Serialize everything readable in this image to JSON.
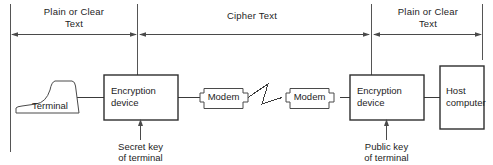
{
  "diagram": {
    "stroke_color": "#3a3a3a",
    "text_color": "#1d1d1d",
    "background": "#ffffff",
    "zones": [
      {
        "id": "zone-left",
        "label_line1": "Plain or Clear",
        "label_line2": "Text"
      },
      {
        "id": "zone-middle",
        "label_line1": "Cipher Text",
        "label_line2": ""
      },
      {
        "id": "zone-right",
        "label_line1": "Plain or Clear",
        "label_line2": "Text"
      }
    ],
    "nodes": [
      {
        "id": "terminal",
        "label_line1": "Terminal",
        "label_line2": ""
      },
      {
        "id": "encryption-left",
        "label_line1": "Encryption",
        "label_line2": "device"
      },
      {
        "id": "modem-left",
        "label_line1": "Modem",
        "label_line2": ""
      },
      {
        "id": "modem-right",
        "label_line1": "Modem",
        "label_line2": ""
      },
      {
        "id": "encryption-right",
        "label_line1": "Encryption",
        "label_line2": "device"
      },
      {
        "id": "host-computer",
        "label_line1": "Host",
        "label_line2": "computer"
      }
    ],
    "key_inputs": [
      {
        "id": "secret-key",
        "label_line1": "Secret key",
        "label_line2": "of terminal"
      },
      {
        "id": "public-key",
        "label_line1": "Public key",
        "label_line2": "of terminal"
      }
    ]
  }
}
